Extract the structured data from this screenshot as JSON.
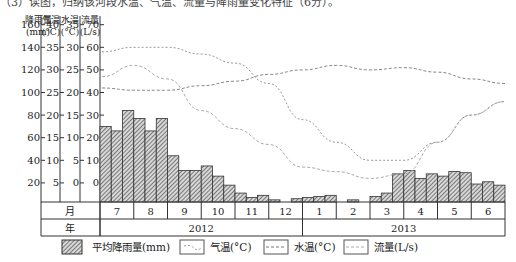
{
  "caption": "（3）读图，归纳该河段水温、气温、流量与降雨量变化特征（6分）。",
  "chart_data": {
    "type": "bar+line",
    "title": "",
    "axes": [
      {
        "name": "降雨量",
        "unit": "(mm)",
        "ticks": [
          20,
          40,
          60,
          80,
          100,
          120,
          140,
          160
        ]
      },
      {
        "name": "气温",
        "unit": "(°C)",
        "ticks": [
          5,
          10,
          15,
          20,
          25,
          30,
          35,
          40
        ]
      },
      {
        "name": "水温",
        "unit": "(°C)",
        "ticks": [
          0,
          5,
          10,
          15,
          20,
          25,
          30,
          35
        ]
      },
      {
        "name": "流量",
        "unit": "(L/s)",
        "ticks": [
          0,
          10,
          20,
          30,
          40,
          50,
          60,
          70
        ]
      }
    ],
    "row_labels": {
      "month": "月",
      "year": "年"
    },
    "months": [
      "7",
      "8",
      "9",
      "10",
      "11",
      "12",
      "1",
      "2",
      "3",
      "4",
      "5",
      "6"
    ],
    "years": [
      {
        "label": "2012",
        "span": 6
      },
      {
        "label": "2013",
        "span": 6
      }
    ],
    "series": [
      {
        "name": "平均降雨量(mm)",
        "kind": "bar",
        "note": "three bars per month (approx. 10-day periods)",
        "values": [
          70,
          66,
          84,
          77,
          66,
          77,
          44,
          31,
          31,
          35,
          26,
          18,
          11,
          7,
          9,
          5,
          3,
          6,
          7,
          8,
          9,
          3,
          5,
          3,
          8,
          11,
          28,
          31,
          24,
          28,
          26,
          30,
          29,
          19,
          21,
          18
        ]
      },
      {
        "name": "气温(°C)",
        "kind": "line",
        "axis": "气温",
        "x": [
          0,
          1,
          2,
          3,
          4,
          5,
          6,
          7,
          8,
          9,
          10,
          11,
          12
        ],
        "values": [
          34,
          35,
          35,
          33.5,
          31.5,
          27,
          19,
          14,
          10,
          10,
          14,
          20,
          23
        ]
      },
      {
        "name": "水温(°C)",
        "kind": "line",
        "axis": "水温",
        "x": [
          0,
          1,
          2,
          3,
          4,
          5,
          6,
          7,
          8,
          9,
          10,
          11,
          12
        ],
        "values": [
          21,
          20.5,
          20.5,
          21.5,
          22.5,
          24,
          25,
          26,
          25,
          25.5,
          24.5,
          23,
          22
        ]
      },
      {
        "name": "流量(L/s)",
        "kind": "line",
        "axis": "流量",
        "x": [
          0,
          1,
          2,
          3,
          4,
          5,
          6,
          7,
          8,
          9,
          10,
          11,
          12
        ],
        "values": [
          47,
          52,
          46,
          32,
          24,
          17,
          7,
          5,
          2,
          4,
          18,
          30,
          36
        ]
      }
    ],
    "legend_position": "bottom",
    "grid": false
  },
  "legend": [
    {
      "label": "平均降雨量(mm)",
      "icon": "hatched-bar-icon"
    },
    {
      "label": "气温(°C)",
      "icon": "dashed-line-icon"
    },
    {
      "label": "水温(°C)",
      "icon": "dashed-line-icon"
    },
    {
      "label": "流量(L/s)",
      "icon": "dashed-line-icon"
    }
  ],
  "colors": {
    "bar_fill": "#9a9a9a",
    "bar_stroke": "#333333",
    "line": "#b0b0b0",
    "axis": "#333333"
  }
}
